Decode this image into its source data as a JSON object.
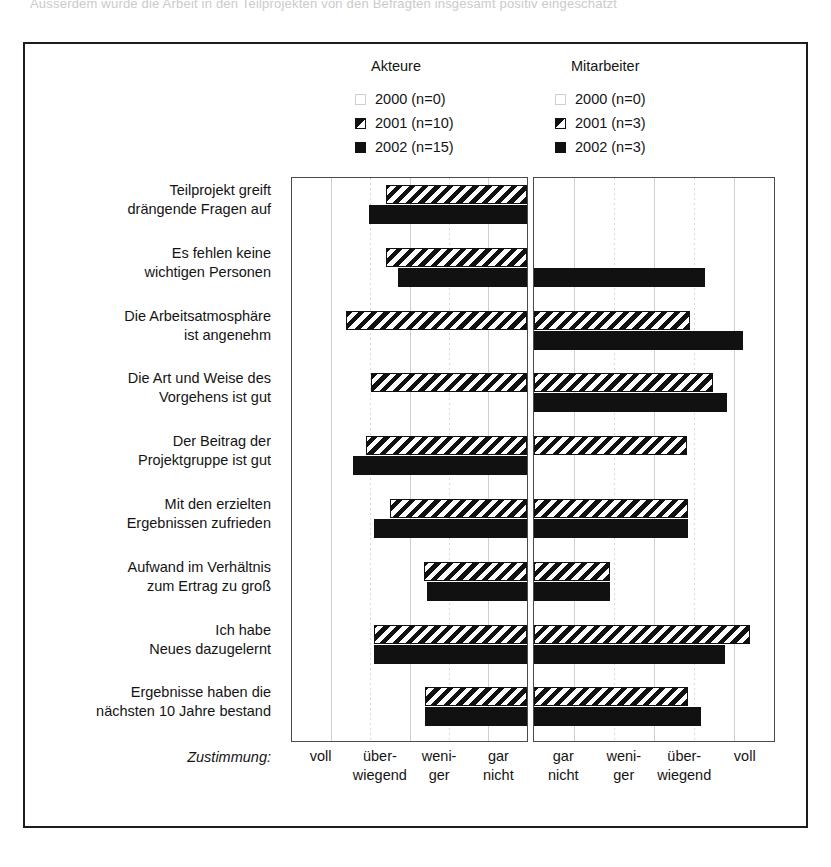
{
  "top_partial_text": "Ausserdem wurde die Arbeit in den Teilprojekten von den Befragten insgesamt positiv eingeschätzt",
  "legend": {
    "groups": [
      {
        "name": "akteure",
        "title": "Akteure",
        "entries": [
          {
            "swatch": "empty-square-icon",
            "label": "2000 (n=0)"
          },
          {
            "swatch": "hatched-square-icon",
            "label": "2001 (n=10)"
          },
          {
            "swatch": "filled-square-icon",
            "label": "2002 (n=15)"
          }
        ]
      },
      {
        "name": "mitarbeiter",
        "title": "Mitarbeiter",
        "entries": [
          {
            "swatch": "empty-square-icon",
            "label": "2000 (n=0)"
          },
          {
            "swatch": "hatched-square-icon",
            "label": "2001 (n=3)"
          },
          {
            "swatch": "filled-square-icon",
            "label": "2002 (n=3)"
          }
        ]
      }
    ]
  },
  "axis": {
    "caption": "Zustimmung:",
    "left_ticks": [
      "voll",
      "über-\nwiegend",
      "weni-\nger",
      "gar\nnicht"
    ],
    "right_ticks": [
      "gar\nnicht",
      "weni-\nger",
      "über-\nwiegend",
      "voll"
    ],
    "left_ticks_flat": [
      "voll",
      "über-",
      "wiegend",
      "weni-",
      "ger",
      "gar",
      "nicht"
    ],
    "right_ticks_flat": [
      "gar",
      "nicht",
      "weni-",
      "ger",
      "über-",
      "wiegend",
      "voll"
    ]
  },
  "colors": {
    "ink": "#111111",
    "frame": "#1c1c1c",
    "panel_border": "#4a4a4a",
    "gridline": "#cfcfcf",
    "background": "#ffffff"
  },
  "chart_data": {
    "type": "bar",
    "orientation": "horizontal",
    "title": "",
    "xlabel": "Zustimmung:",
    "ylabel": "",
    "grid": true,
    "legend_position": "top",
    "note": "Two mirrored horizontal bar panels. Left panel (Akteure) axis runs voll -> gar nicht left-to-right with bars anchored at the RIGHT edge growing leftward. Right panel (Mitarbeiter) axis runs gar nicht -> voll left-to-right with bars anchored at the LEFT edge growing rightward. Scale 0-4 in category units, 4 = full panel width.",
    "xlim": [
      0,
      4
    ],
    "categories": [
      "Teilprojekt greift drängende Fragen auf",
      "Es fehlen keine wichtigen Personen",
      "Die Arbeitsatmosphäre ist angenehm",
      "Die Art und Weise des Vorgehens ist gut",
      "Der Beitrag der Projektgruppe ist gut",
      "Mit den erzielten Ergebnissen zufrieden",
      "Aufwand im Verhältnis zum Ertrag zu groß",
      "Ich habe Neues dazugelernt",
      "Ergebnisse haben die nächsten 10 Jahre bestand"
    ],
    "categories_lines": [
      [
        "Teilprojekt greift",
        "drängende Fragen auf"
      ],
      [
        "Es fehlen keine",
        "wichtigen Personen"
      ],
      [
        "Die Arbeitsatmosphäre",
        "ist angenehm"
      ],
      [
        "Die Art und Weise des",
        "Vorgehens ist gut"
      ],
      [
        "Der Beitrag der",
        "Projektgruppe ist gut"
      ],
      [
        "Mit den erzielten",
        "Ergebnissen zufrieden"
      ],
      [
        "Aufwand im Verhältnis",
        "zum Ertrag zu groß"
      ],
      [
        "Ich habe",
        "Neues dazugelernt"
      ],
      [
        "Ergebnisse haben die",
        "nächsten 10 Jahre bestand"
      ]
    ],
    "panels": [
      {
        "name": "Akteure",
        "anchor": "right",
        "series": [
          {
            "name": "2000 (n=0)",
            "style": "empty",
            "values": [
              0,
              0,
              0,
              0,
              0,
              0,
              0,
              0,
              0
            ]
          },
          {
            "name": "2001 (n=10)",
            "style": "hatched",
            "values": [
              2.4,
              2.4,
              3.08,
              2.66,
              2.74,
              2.33,
              1.76,
              2.6,
              1.74
            ]
          },
          {
            "name": "2002 (n=15)",
            "style": "filled",
            "values": [
              2.69,
              2.2,
              0,
              0,
              2.96,
              2.6,
              1.71,
              2.6,
              1.74
            ]
          }
        ]
      },
      {
        "name": "Mitarbeiter",
        "anchor": "left",
        "series": [
          {
            "name": "2000 (n=0)",
            "style": "empty",
            "values": [
              0,
              0,
              0,
              0,
              0,
              0,
              0,
              0,
              0
            ]
          },
          {
            "name": "2001 (n=3)",
            "style": "hatched",
            "values": [
              0,
              0,
              2.6,
              2.98,
              2.55,
              2.56,
              1.27,
              3.6,
              2.56
            ]
          },
          {
            "name": "2002 (n=3)",
            "style": "filled",
            "values": [
              0,
              2.85,
              3.49,
              3.22,
              0,
              2.56,
              1.27,
              3.19,
              2.78
            ]
          }
        ]
      }
    ]
  }
}
